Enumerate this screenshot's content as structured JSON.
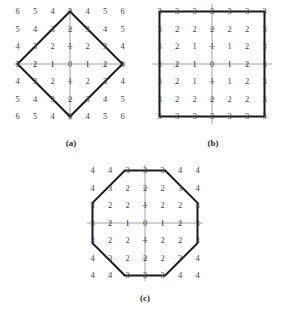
{
  "figure": {
    "type": "distance-metric-balls",
    "panels": [
      {
        "id": "a",
        "caption": "(a)",
        "shape": "diamond",
        "metric": "city-block",
        "radius": 3,
        "grid": [
          [
            6,
            5,
            4,
            3,
            4,
            5,
            6
          ],
          [
            5,
            4,
            3,
            2,
            3,
            4,
            5
          ],
          [
            4,
            3,
            2,
            1,
            2,
            3,
            4
          ],
          [
            3,
            2,
            1,
            0,
            1,
            2,
            3
          ],
          [
            4,
            3,
            2,
            1,
            2,
            3,
            4
          ],
          [
            5,
            4,
            3,
            2,
            3,
            4,
            5
          ],
          [
            6,
            5,
            4,
            3,
            4,
            5,
            6
          ]
        ]
      },
      {
        "id": "b",
        "caption": "(b)",
        "shape": "square",
        "metric": "chessboard",
        "radius": 3,
        "grid": [
          [
            3,
            3,
            3,
            3,
            3,
            3,
            3
          ],
          [
            3,
            2,
            2,
            2,
            2,
            2,
            3
          ],
          [
            3,
            2,
            1,
            1,
            1,
            2,
            3
          ],
          [
            3,
            2,
            1,
            0,
            1,
            2,
            3
          ],
          [
            3,
            2,
            1,
            1,
            1,
            2,
            3
          ],
          [
            3,
            2,
            2,
            2,
            2,
            2,
            3
          ],
          [
            3,
            3,
            3,
            3,
            3,
            3,
            3
          ]
        ]
      },
      {
        "id": "c",
        "caption": "(c)",
        "shape": "octagon",
        "metric": "octagonal",
        "radius": 3,
        "grid": [
          [
            4,
            4,
            3,
            3,
            3,
            4,
            4
          ],
          [
            4,
            3,
            2,
            2,
            2,
            3,
            4
          ],
          [
            3,
            2,
            2,
            1,
            2,
            2,
            3
          ],
          [
            3,
            2,
            1,
            0,
            1,
            2,
            3
          ],
          [
            3,
            2,
            2,
            1,
            2,
            2,
            3
          ],
          [
            4,
            3,
            2,
            2,
            2,
            3,
            4
          ],
          [
            4,
            4,
            3,
            3,
            3,
            4,
            4
          ]
        ]
      }
    ],
    "colors": {
      "shape_stroke": "#1a1a1a",
      "axis": "#8a8a8a",
      "number": "#454545",
      "background": "#ffffff"
    }
  }
}
